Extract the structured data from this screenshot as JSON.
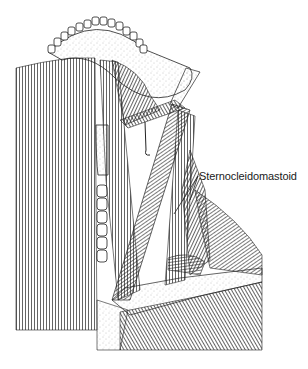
{
  "figure": {
    "labels": [
      {
        "text": "Sternocleidomastoid",
        "x": 200,
        "y": 170
      }
    ]
  },
  "colors": {
    "ink": "#1a1a1a",
    "paper": "#ffffff",
    "stipple": "#8a8a8a"
  }
}
